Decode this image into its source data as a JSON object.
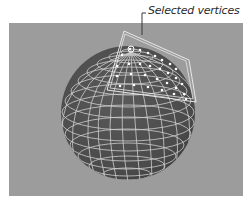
{
  "callout": {
    "label": "Selected vertices"
  },
  "viewport": {
    "background": "#9c9c9c"
  },
  "sphere": {
    "fill": "#4e4e4e",
    "wire": "#cfcfcf",
    "selected_vertex_color": "#ffffff",
    "selection_outline": "#e8e8e8"
  }
}
